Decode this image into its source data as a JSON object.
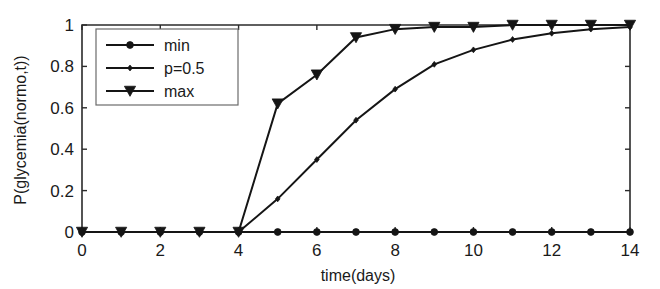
{
  "chart_data": {
    "type": "line",
    "title": "",
    "subtitle": "",
    "xlabel": "time(days)",
    "ylabel": "P(glycemia(normo,t))",
    "xlim": [
      0,
      14
    ],
    "ylim": [
      0,
      1
    ],
    "grid": false,
    "legend_position": "upper left",
    "x": [
      0,
      1,
      2,
      3,
      4,
      5,
      6,
      7,
      8,
      9,
      10,
      11,
      12,
      13,
      14
    ],
    "xticks": [
      0,
      2,
      4,
      6,
      8,
      10,
      12,
      14
    ],
    "xticklabels": [
      "0",
      "2",
      "4",
      "6",
      "8",
      "10",
      "12",
      "14"
    ],
    "yticks": [
      0,
      0.2,
      0.4,
      0.6,
      0.8,
      1
    ],
    "yticklabels": [
      "0",
      "0.2",
      "0.4",
      "0.6",
      "0.8",
      "1"
    ],
    "series": [
      {
        "name": "min",
        "marker": "circle",
        "values": [
          0,
          0,
          0,
          0,
          0,
          0,
          0,
          0,
          0,
          0,
          0,
          0,
          0,
          0,
          0
        ]
      },
      {
        "name": "p=0.5",
        "marker": "diamond",
        "values": [
          0,
          0,
          0,
          0,
          0,
          0.16,
          0.35,
          0.54,
          0.69,
          0.81,
          0.88,
          0.93,
          0.96,
          0.98,
          0.99
        ]
      },
      {
        "name": "max",
        "marker": "triangle-down",
        "values": [
          0,
          0,
          0,
          0,
          0,
          0.62,
          0.76,
          0.94,
          0.98,
          0.99,
          0.99,
          1,
          1,
          1,
          1
        ]
      }
    ]
  },
  "legend": {
    "entries": [
      {
        "label": "min"
      },
      {
        "label": "p=0.5"
      },
      {
        "label": "max"
      }
    ]
  },
  "colors": {
    "line": "#151515",
    "axis": "#2b2b2b",
    "background": "#ffffff",
    "legend_border": "#6b6b6b"
  }
}
